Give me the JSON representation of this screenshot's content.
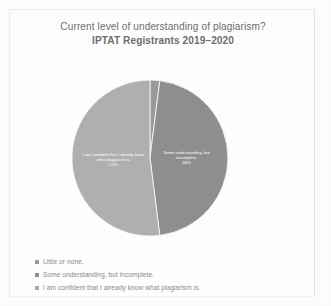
{
  "document": {
    "background_color": "#fdfdfc",
    "frame_color": "#ececec"
  },
  "header": {
    "title": "Current level of understanding of plagiarism?",
    "subtitle": "IPTAT Registrants 2019–2020"
  },
  "legend": {
    "items": [
      {
        "label": "Little or none.",
        "color": "#9a9a9a"
      },
      {
        "label": "Some understanding, but incomplete.",
        "color": "#8f8f8f"
      },
      {
        "label": "I am confident that I already know what plagiarism is.",
        "color": "#a8a8a8"
      }
    ]
  },
  "chart_data": {
    "type": "pie",
    "title": "Current level of understanding of plagiarism?",
    "subtitle": "IPTAT Registrants 2019–2020",
    "categories": [
      "Little or none.",
      "Some understanding, but incomplete.",
      "I am confident that I already know what plagiarism is."
    ],
    "values": [
      2,
      46,
      52
    ],
    "value_labels": [
      "2%",
      "46%",
      "52%"
    ],
    "colors": [
      "#9a9a9a",
      "#8f8f8f",
      "#b0b0b0"
    ],
    "legend_position": "bottom-left",
    "grid": false,
    "slice_labels": [
      {
        "name": "Little or none.",
        "text_line1": "",
        "text_line2": "",
        "pct": "",
        "shown": false
      },
      {
        "name": "Some understanding, but incomplete.",
        "text_line1": "Some understanding, but",
        "text_line2": "incomplete.",
        "pct": "46%",
        "shown": true
      },
      {
        "name": "I am confident that I already know what plagiarism is.",
        "text_line1": "I am confident that I already know",
        "text_line2": "what plagiarism is.",
        "pct": "52%",
        "shown": true
      }
    ]
  }
}
